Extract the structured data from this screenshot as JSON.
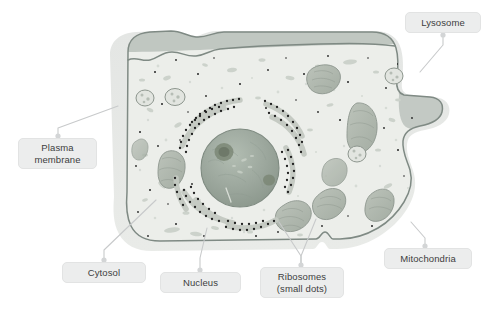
{
  "diagram": {
    "background_color": "#ffffff"
  },
  "colors": {
    "cell_halo": "#e6e8e6",
    "cytosol": "#eceeea",
    "membrane_line": "#7f8a84",
    "membrane_shadow": "#b9bfba",
    "nucleus": "#9aa79c",
    "nucleolus": "#73806f",
    "mitochondria": "#b0b8ae",
    "organelle_outline": "#8d968e",
    "ribosome_dot": "#1f1f1f",
    "label_fill": "#eceded",
    "label_border": "#e2e3e3",
    "label_text": "#3d3d3d",
    "leader_line": "#c8cacb"
  },
  "labels": [
    {
      "id": "lysosome",
      "text": "Lysosome",
      "x": 405,
      "y": 12,
      "width": 76,
      "height": 21,
      "lines": 1
    },
    {
      "id": "plasma-membrane",
      "text": "Plasma\nmembrane",
      "x": 18,
      "y": 138,
      "width": 79,
      "height": 31,
      "lines": 2
    },
    {
      "id": "cytosol",
      "text": "Cytosol",
      "x": 62,
      "y": 262,
      "width": 84,
      "height": 21,
      "lines": 1
    },
    {
      "id": "nucleus",
      "text": "Nucleus",
      "x": 160,
      "y": 272,
      "width": 81,
      "height": 21,
      "lines": 1
    },
    {
      "id": "ribosomes",
      "text": "Ribosomes\n(small dots)",
      "x": 260,
      "y": 267,
      "width": 84,
      "height": 31,
      "lines": 2
    },
    {
      "id": "mitochondria",
      "text": "Mitochondria",
      "x": 384,
      "y": 248,
      "width": 88,
      "height": 21,
      "lines": 1
    }
  ],
  "leaders": [
    {
      "id": "lysosome-leader",
      "from_label": "lysosome",
      "points": "443,33 443,45 420,72"
    },
    {
      "id": "plasma-membrane-leader",
      "from_label": "plasma-membrane",
      "points": "58,138 58,129 118,106"
    },
    {
      "id": "cytosol-leader",
      "from_label": "cytosol",
      "points": "104,262 104,252 155,200"
    },
    {
      "id": "nucleus-leader",
      "from_label": "nucleus",
      "points": "200,272 200,260 206,228"
    },
    {
      "id": "ribosomes-leader-left",
      "from_label": "ribosomes",
      "points": "301,267 301,258 280,222"
    },
    {
      "id": "ribosomes-leader-right",
      "from_label": "ribosomes",
      "points": "301,267 301,258 315,220"
    },
    {
      "id": "mitochondria-leader",
      "from_label": "mitochondria",
      "points": "425,248 425,240 412,223"
    }
  ],
  "structures": [
    {
      "id": "plasma-membrane",
      "kind": "boundary",
      "description": "Outer cell boundary with halo and dark inner membrane line"
    },
    {
      "id": "cytosol",
      "kind": "fill",
      "description": "Pale gray-green interior fluid with speckles"
    },
    {
      "id": "nucleus",
      "kind": "organelle",
      "description": "Large central gray-green sphere with two nucleoli"
    },
    {
      "id": "rough-er",
      "kind": "organelle",
      "description": "Curved ribbon arcs around nucleus studded with ribosome dots"
    },
    {
      "id": "mitochondria",
      "kind": "organelle",
      "description": "Elongated bean-shaped organelles with internal cristae texture",
      "count": 8
    },
    {
      "id": "lysosomes",
      "kind": "organelle",
      "description": "Small round vesicles with internal specks",
      "count": 4
    },
    {
      "id": "ribosomes",
      "kind": "organelle",
      "description": "Small black dots scattered in cytosol and on rough ER"
    }
  ]
}
